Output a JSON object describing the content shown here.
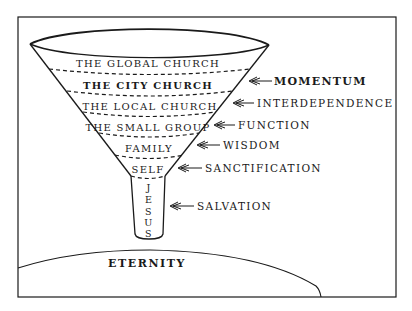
{
  "diagram": {
    "type": "funnel",
    "colors": {
      "ink": "#1a1a1a",
      "background": "#ffffff"
    },
    "bands": [
      {
        "label": "THE GLOBAL CHURCH",
        "bold": false
      },
      {
        "label": "THE CITY CHURCH",
        "bold": true
      },
      {
        "label": "THE LOCAL CHURCH",
        "bold": false
      },
      {
        "label": "THE SMALL GROUP",
        "bold": false
      },
      {
        "label": "FAMILY",
        "bold": false
      },
      {
        "label": "SELF",
        "bold": false
      }
    ],
    "spout": {
      "label": "JESUS",
      "letters": [
        "J",
        "E",
        "S",
        "U",
        "S"
      ]
    },
    "annotations": [
      {
        "label": "MOMENTUM",
        "bold": true
      },
      {
        "label": "INTERDEPENDENCE",
        "bold": false
      },
      {
        "label": "FUNCTION",
        "bold": false
      },
      {
        "label": "WISDOM",
        "bold": false
      },
      {
        "label": "SANCTIFICATION",
        "bold": false
      },
      {
        "label": "SALVATION",
        "bold": false
      }
    ],
    "base": {
      "label": "ETERNITY"
    }
  }
}
